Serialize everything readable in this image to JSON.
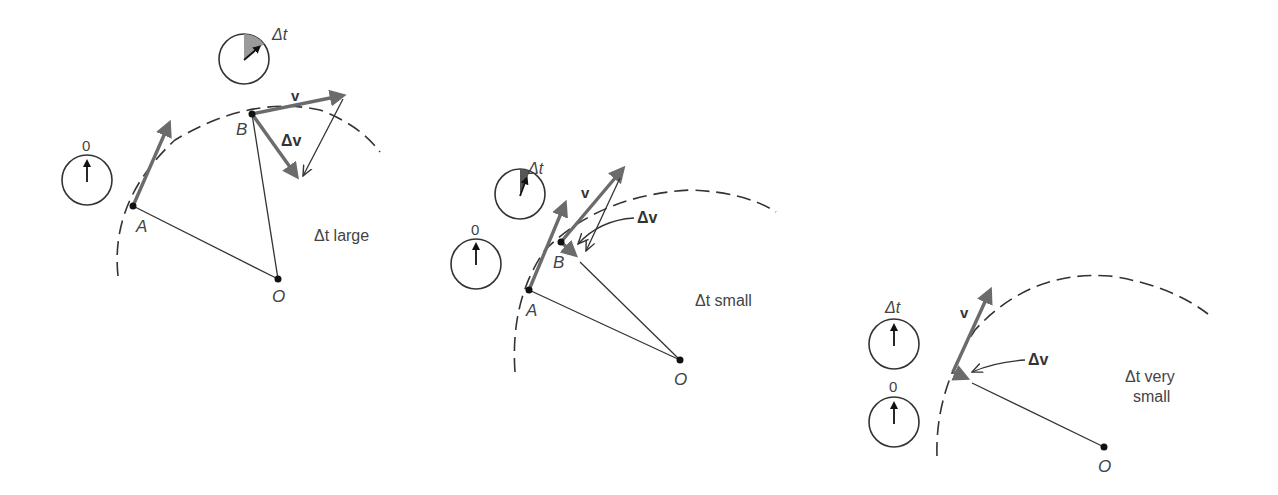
{
  "figure": {
    "colors": {
      "vector_gray": "#6b6b6b",
      "line": "#333333",
      "wedge_gray": "#9a9a9a",
      "wedge_dark": "#555555"
    },
    "panels": [
      {
        "id": "large",
        "caption": "Δt large",
        "clock_start_label": "0",
        "clock_end_label": "Δt",
        "point_a_label": "A",
        "point_b_label": "B",
        "center_label": "O",
        "velocity_label": "v",
        "delta_v_label": "Δv"
      },
      {
        "id": "small",
        "caption": "Δt small",
        "clock_start_label": "0",
        "clock_end_label": "Δt",
        "point_a_label": "A",
        "point_b_label": "B",
        "center_label": "O",
        "velocity_label": "v",
        "delta_v_label": "Δv"
      },
      {
        "id": "very-small",
        "caption_line1": "Δt very",
        "caption_line2": "small",
        "clock_start_label": "0",
        "clock_end_label": "Δt",
        "center_label": "O",
        "velocity_label": "v",
        "delta_v_label": "Δv"
      }
    ]
  }
}
